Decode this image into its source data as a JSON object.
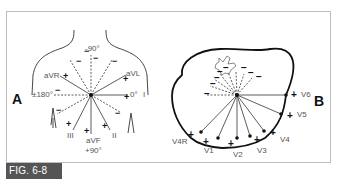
{
  "figure": {
    "label": "FIG. 6-8",
    "panel_a": {
      "letter": "A",
      "title": "Hexaxial reference system (frontal plane)",
      "axis_labels": {
        "top": "-90°",
        "left": "±180°",
        "right": "0°",
        "bottom": "+90°"
      },
      "leads": [
        "aVR",
        "aVL",
        "I",
        "II",
        "III",
        "aVF"
      ],
      "signs": {
        "positive": "+",
        "negative": "−"
      }
    },
    "panel_b": {
      "letter": "B",
      "title": "Horizontal plane (precordial leads)",
      "leads": [
        "V6",
        "V5",
        "V4",
        "V3",
        "V2",
        "V1",
        "V4R"
      ],
      "signs": {
        "positive": "+",
        "negative": "−"
      }
    },
    "colors": {
      "line": "#333333",
      "label_bg": "#555555",
      "label_text": "#ffffff",
      "frame": "#bdbdbd"
    }
  }
}
